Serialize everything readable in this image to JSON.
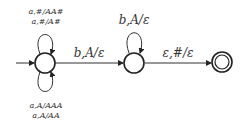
{
  "diagram": {
    "type": "pushdown-automaton",
    "colors": {
      "stroke": "#222222",
      "text": "#333333",
      "background": "#ffffff"
    },
    "states": [
      {
        "id": "q0",
        "start": true,
        "accepting": false
      },
      {
        "id": "q1",
        "start": false,
        "accepting": false
      },
      {
        "id": "q2",
        "start": false,
        "accepting": true
      }
    ],
    "transitions": {
      "q0_loop_top": [
        "a,#/AA#",
        "a,#/A#"
      ],
      "q0_loop_bottom": [
        "a,A/AAA",
        "a,A/AA"
      ],
      "q0_to_q1": "b,A/ε",
      "q1_loop": "b,A/ε",
      "q1_to_q2": "ε,#/ε"
    }
  }
}
